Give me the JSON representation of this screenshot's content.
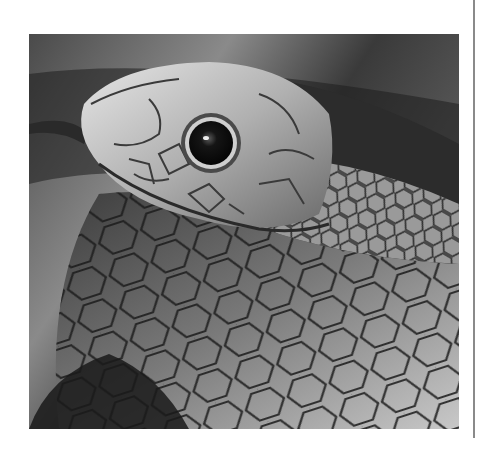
{
  "image": {
    "subject": "close-up of a snake's head and coiled scaled body",
    "style": "grayscale photograph",
    "colors": {
      "background_dark": "#1e1e1e",
      "background_mid": "#5a5a5a",
      "scale_light": "#d8d8d8",
      "scale_mid": "#8c8c8c",
      "scale_dark": "#3c3c3c",
      "eye": "#0d0d0d",
      "page": "#ffffff",
      "rule": "#8a8a8a"
    }
  }
}
